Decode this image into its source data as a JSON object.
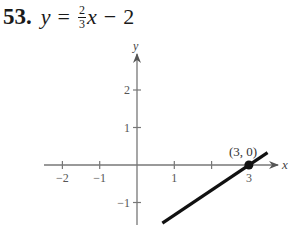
{
  "problem": {
    "number": "53.",
    "lhs": "y",
    "equals": "=",
    "fraction": {
      "numerator": "2",
      "denominator": "3"
    },
    "variable": "x",
    "minus": "−",
    "constant": "2"
  },
  "chart_data": {
    "type": "line",
    "xlabel": "x",
    "ylabel": "y",
    "xlim": [
      -2.5,
      3.5
    ],
    "ylim": [
      -1.7,
      2.5
    ],
    "x_ticks": [
      -2,
      -1,
      1,
      2,
      3
    ],
    "x_tick_labels": [
      "−2",
      "−1",
      "1",
      "",
      "3"
    ],
    "y_ticks": [
      -1,
      1,
      2
    ],
    "y_tick_labels": [
      "−1",
      "1",
      "2"
    ],
    "grid": false,
    "series": [
      {
        "name": "y = (2/3)x - 2",
        "x": [
          0.68,
          3.5
        ],
        "y": [
          -1.55,
          0.33
        ]
      }
    ],
    "points": [
      {
        "x": 3,
        "y": 0,
        "label": "(3, 0)"
      }
    ]
  }
}
